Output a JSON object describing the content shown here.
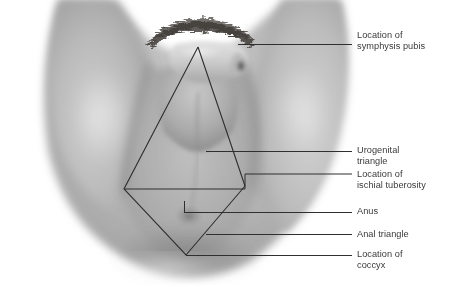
{
  "figure": {
    "background_color": "#ffffff",
    "line_color": "#2f2f2f",
    "text_color": "#3a3a3a",
    "skin_tone": "#b4b4b4"
  },
  "labels": [
    {
      "id": "symphysis-pubis",
      "text": "Location of\nsymphysis pubis",
      "x": 357,
      "y": 30
    },
    {
      "id": "urogenital-triangle",
      "text": "Urogenital\ntriangle",
      "x": 357,
      "y": 145
    },
    {
      "id": "ischial-tuberosity",
      "text": "Location of\nischial tuberosity",
      "x": 357,
      "y": 169
    },
    {
      "id": "anus",
      "text": "Anus",
      "x": 357,
      "y": 206
    },
    {
      "id": "anal-triangle",
      "text": "Anal triangle",
      "x": 357,
      "y": 229
    },
    {
      "id": "coccyx",
      "text": "Location of\ncoccyx",
      "x": 357,
      "y": 249
    }
  ],
  "leader_lines": [
    {
      "id": "leader-symphysis-pubis",
      "points": "238,44 352,44"
    },
    {
      "id": "leader-urogenital-triangle",
      "points": "206,151 352,151"
    },
    {
      "id": "leader-ischial-tuberosity",
      "points": "124,189 245,189 245,174 352,174"
    },
    {
      "id": "leader-anus",
      "points": "184,212 352,212"
    },
    {
      "id": "leader-anus-tick",
      "points": "184,201 184,212"
    },
    {
      "id": "leader-anal-triangle",
      "points": "206,234 352,234"
    },
    {
      "id": "leader-coccyx",
      "points": "186,255 352,255"
    }
  ],
  "perineum_outline": {
    "id": "perineum-diamond",
    "description": "Diamond formed by urogenital triangle above and anal triangle below",
    "apex_top": "198,47",
    "vertex_left": "124,189",
    "vertex_right": "245,186",
    "apex_bottom": "186,255"
  }
}
